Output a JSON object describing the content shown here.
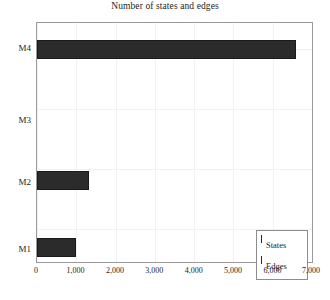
{
  "chart_data": {
    "type": "bar",
    "orientation": "horizontal",
    "title": "Number of states and edges",
    "xlabel": "",
    "ylabel": "",
    "categories": [
      "M1",
      "M2",
      "M3",
      "M4"
    ],
    "categories_top_to_bottom": [
      "M4",
      "M3",
      "M2",
      "M1"
    ],
    "series": [
      {
        "name": "States",
        "values": [
          0,
          0,
          0,
          0
        ]
      },
      {
        "name": "Edges",
        "values": [
          980,
          1320,
          0,
          6600
        ]
      }
    ],
    "values": [
      980,
      1320,
      0,
      6600
    ],
    "xlim": [
      0,
      7000
    ],
    "ylim": [
      0,
      4
    ],
    "xticks": [
      0,
      1000,
      2000,
      3000,
      4000,
      5000,
      6000,
      7000
    ],
    "xtick_labels": [
      "0",
      "1,000",
      "2,000",
      "3,000",
      "4,000",
      "5,000",
      "6,000",
      "7,000"
    ],
    "ytick_labels": [
      "M4",
      "M3",
      "M2",
      "M1"
    ],
    "grid": true,
    "grid_color": "#f1f1f1",
    "bar_color": "#2b2b2b",
    "frame_color": "#9a9a9a",
    "legend_position": "lower right",
    "legend_entries": [
      "States",
      "Edges"
    ]
  },
  "legend": {
    "entries": [
      {
        "label": "States",
        "color": "#2b2b2b"
      },
      {
        "label": "Edges",
        "color": "#2b2b2b"
      }
    ]
  },
  "caption": {
    "remnant": ""
  }
}
